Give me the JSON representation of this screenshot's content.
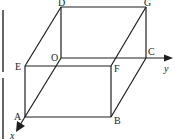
{
  "diagram": {
    "colors": {
      "line": "#1f1f1f",
      "background": "#ffffff",
      "edge_bar": "#555555"
    },
    "vertices": {
      "O": {
        "label": "O",
        "x": 61,
        "y": 58
      },
      "A": {
        "label": "A",
        "x": 25,
        "y": 117
      },
      "B": {
        "label": "B",
        "x": 111,
        "y": 117
      },
      "C": {
        "label": "C",
        "x": 146,
        "y": 58
      },
      "D": {
        "label": "D",
        "x": 61,
        "y": 7
      },
      "E": {
        "label": "E",
        "x": 25,
        "y": 66
      },
      "F": {
        "label": "F",
        "x": 111,
        "y": 66
      },
      "G": {
        "label": "G",
        "x": 146,
        "y": 7
      }
    },
    "axes": {
      "x": {
        "label": "x"
      },
      "y": {
        "label": "y"
      }
    }
  }
}
